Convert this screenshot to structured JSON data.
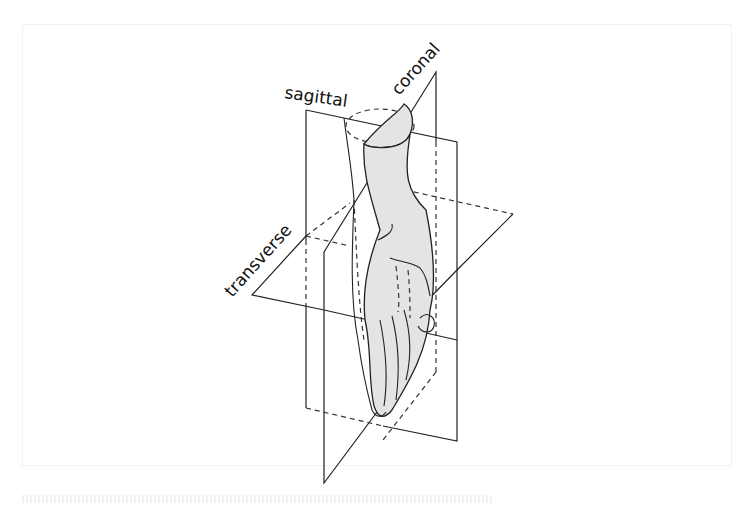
{
  "diagram": {
    "labels": {
      "sagittal": "sagittal",
      "coronal": "coronal",
      "transverse": "transverse"
    },
    "colors": {
      "stroke": "#222222",
      "fill_shaded": "#e4e4e4",
      "background": "#ffffff"
    }
  }
}
